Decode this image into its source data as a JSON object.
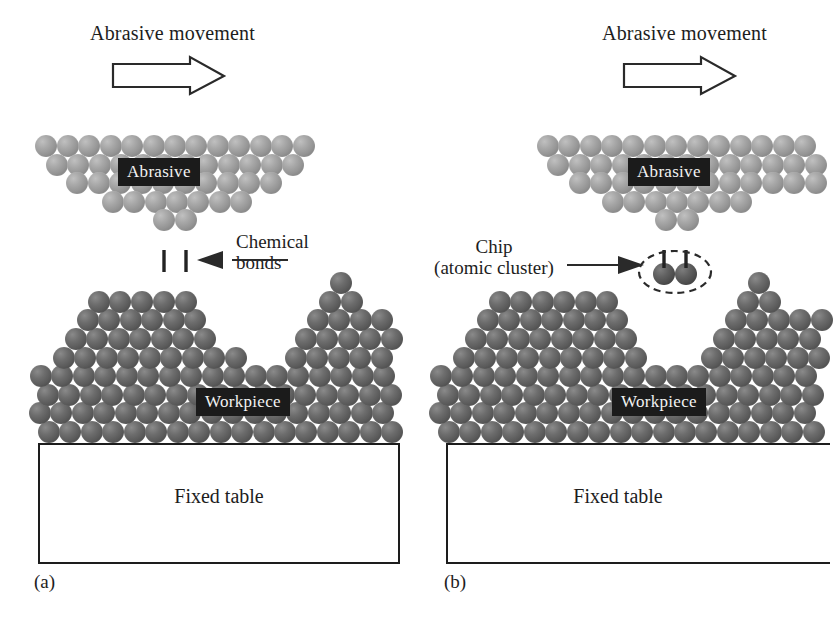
{
  "figure": {
    "width": 824,
    "height": 629,
    "background": "#ffffff",
    "type": "scientific-schematic"
  },
  "colors": {
    "abrasive_atom": "#949494",
    "workpiece_atom": "#5a5a5a",
    "chip_atom": "#4e4e4e",
    "ink": "#1d1d1d",
    "tag_background": "#1b1b1b",
    "tag_text": "#f2f2f2",
    "page_background": "#ffffff"
  },
  "panels": [
    {
      "id": "a",
      "label": "(a)",
      "title": "Abrasive movement",
      "arrow": {
        "name": "block-arrow-right",
        "direction": "right"
      },
      "tags": {
        "abrasive": "Abrasive",
        "workpiece": "Workpiece"
      },
      "table": {
        "text": "Fixed table"
      },
      "callout": {
        "name": "chemical-bonds-callout",
        "line1": "Chemical",
        "line2": "bonds",
        "arrow_direction": "left",
        "describes": "bonds between abrasive tip atoms and workpiece surface atoms"
      }
    },
    {
      "id": "b",
      "label": "(b)",
      "title": "Abrasive movement",
      "arrow": {
        "name": "block-arrow-right",
        "direction": "right"
      },
      "tags": {
        "abrasive": "Abrasive",
        "workpiece": "Workpiece"
      },
      "table": {
        "text": "Fixed table"
      },
      "callout": {
        "name": "chip-callout",
        "line1": "Chip",
        "line2": "(atomic cluster)",
        "arrow_direction": "right",
        "describes": "detached two-atom cluster enclosed by a dashed ellipse"
      }
    }
  ],
  "legend_meaning": {
    "light_spheres": "Abrasive grain atoms",
    "dark_spheres": "Workpiece atoms",
    "dashed_ellipse": "Removed chip (atomic cluster)"
  }
}
